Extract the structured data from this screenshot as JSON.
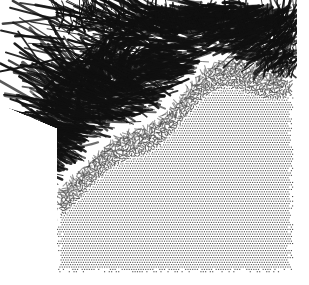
{
  "figure": {
    "title": "",
    "kind": "particle-trajectory-snapshot",
    "background_color": "#ffffff",
    "ink_color": "#101010",
    "lattice_color": "#3a3a3a",
    "width": 309,
    "height": 285,
    "alt_text": "Monochrome stippled scientific figure: a dense ordered dot lattice occupying the lower two thirds of a square region, with a disordered dark band of streak-like particle trajectories along the upper edge radiating outward to the upper left."
  },
  "chart_data": {
    "type": "scatter",
    "title": "",
    "xlabel": "",
    "ylabel": "",
    "xlim": [
      0,
      1
    ],
    "ylim": [
      0,
      1
    ],
    "grid": false,
    "legend": null,
    "annotations": [],
    "regions": [
      {
        "name": "ordered-lattice",
        "description": "regular square dot lattice, uniform density",
        "x_range_px": [
          57,
          293
        ],
        "y_range_px": [
          120,
          272
        ],
        "lattice_spacing_px": 2.35,
        "dot_size_px": 1.2,
        "fill_gray": "#4a4a4a",
        "order_parameter": 1.0
      },
      {
        "name": "melt-transition",
        "description": "lattice progressively disordered, dots elongate into short dashes",
        "x_range_px": [
          57,
          293
        ],
        "y_range_px": [
          70,
          130
        ],
        "order_parameter": 0.5
      },
      {
        "name": "disordered-streak-band",
        "description": "dark band of long trajectory streaks, heavily overlapping ink",
        "x_range_px": [
          14,
          297
        ],
        "y_range_px": [
          8,
          115
        ],
        "order_parameter": 0.0,
        "mean_streak_length_px": 26,
        "mean_streak_angle_deg": 196
      },
      {
        "name": "vortex",
        "description": "circular swirl of trajectories in upper-middle-left of the streak band",
        "center_px": [
          120,
          72
        ],
        "radius_px": 34
      }
    ],
    "frame_px": {
      "left": 57,
      "top": 8,
      "right": 293,
      "bottom": 272
    },
    "n_lattice_rows": 64,
    "n_lattice_cols": 100,
    "n_streaks": 900
  }
}
